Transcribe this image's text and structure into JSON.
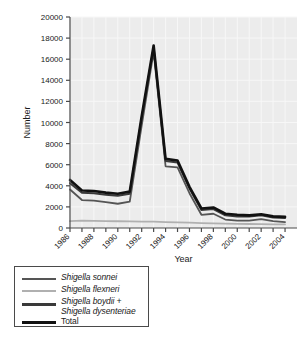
{
  "chart_data": {
    "type": "line",
    "title": "",
    "xlabel": "Year",
    "ylabel": "Number",
    "xlim": [
      1986,
      2005
    ],
    "ylim": [
      0,
      20000
    ],
    "ytick_values": [
      0,
      2000,
      4000,
      6000,
      8000,
      10000,
      12000,
      14000,
      16000,
      18000,
      20000
    ],
    "ytick_labels": [
      "0",
      "2000",
      "4000",
      "6000",
      "8000",
      "10000",
      "12000",
      "14000",
      "16000",
      "18000",
      "20000"
    ],
    "xtick_values": [
      1986,
      1987,
      1988,
      1989,
      1990,
      1991,
      1992,
      1993,
      1994,
      1995,
      1996,
      1997,
      1998,
      1999,
      2000,
      2001,
      2002,
      2003,
      2004
    ],
    "xtick_labels": [
      "1986",
      "",
      "1988",
      "",
      "1990",
      "",
      "1992",
      "",
      "1994",
      "",
      "1996",
      "",
      "1998",
      "",
      "2000",
      "",
      "2002",
      "",
      "2004"
    ],
    "xtick_labels_shown": [
      "1986",
      "1988",
      "1990",
      "1992",
      "1994",
      "1996",
      "1998",
      "2000",
      "2002",
      "2004"
    ],
    "grid": true,
    "legend_position": "below-left",
    "x": [
      1986,
      1987,
      1988,
      1989,
      1990,
      1991,
      1992,
      1993,
      1994,
      1995,
      1996,
      1997,
      1998,
      1999,
      2000,
      2001,
      2002,
      2003,
      2004
    ],
    "series": [
      {
        "name": "Shigella sonnei",
        "color": "#555555",
        "width": 1.8,
        "values": [
          3650,
          2650,
          2600,
          2450,
          2300,
          2500,
          9700,
          16700,
          5850,
          5750,
          3300,
          1250,
          1350,
          800,
          700,
          700,
          850,
          650,
          550
        ]
      },
      {
        "name": "Shigella flexneri",
        "color": "#b0b0b0",
        "width": 1.8,
        "values": [
          660,
          700,
          680,
          660,
          640,
          620,
          600,
          600,
          560,
          540,
          500,
          460,
          440,
          420,
          400,
          380,
          370,
          350,
          340
        ]
      },
      {
        "name": "Shigella boydii + Shigella dysenteriae",
        "color": "#3a3a3a",
        "width": 2.0,
        "values": [
          4250,
          3350,
          3300,
          3150,
          3050,
          3250,
          10400,
          17100,
          6350,
          6200,
          3750,
          1700,
          1800,
          1200,
          1100,
          1080,
          1200,
          1000,
          950
        ]
      },
      {
        "name": "Total",
        "color": "#111111",
        "width": 2.6,
        "values": [
          4550,
          3550,
          3500,
          3350,
          3250,
          3450,
          10600,
          17300,
          6550,
          6400,
          3900,
          1850,
          1950,
          1350,
          1250,
          1200,
          1300,
          1100,
          1050
        ]
      }
    ]
  },
  "axes": {
    "ylabel": "Number",
    "xlabel": "Year"
  },
  "legend": {
    "entries": [
      {
        "label": "Shigella sonnei",
        "color": "#555555",
        "width": 1.8,
        "italic": true
      },
      {
        "label": "Shigella flexneri",
        "color": "#b0b0b0",
        "width": 1.8,
        "italic": true
      },
      {
        "label": "Shigella boydii +",
        "color": "#3a3a3a",
        "width": 2.2,
        "italic": true
      },
      {
        "label": "Shigella dysenteriae",
        "color": "",
        "width": 0,
        "italic": true
      },
      {
        "label": "Total",
        "color": "#111111",
        "width": 3.0,
        "italic": false
      }
    ]
  },
  "colors": {
    "plot_background": "#ececec",
    "grid": "#f7f7f7",
    "axis": "#4a4a4a",
    "text": "#1a1a1a"
  }
}
